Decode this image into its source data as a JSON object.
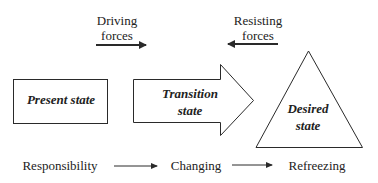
{
  "forces": {
    "driving": {
      "line1": "Driving",
      "line2": "forces"
    },
    "resisting": {
      "line1": "Resisting",
      "line2": "forces"
    }
  },
  "states": {
    "present": "Present state",
    "transition": {
      "line1": "Transition",
      "line2": "state"
    },
    "desired": {
      "line1": "Desired",
      "line2": "state"
    }
  },
  "process": {
    "step1": "Responsibility",
    "step2": "Changing",
    "step3": "Refreezing"
  },
  "colors": {
    "stroke": "#2a2a2a",
    "background": "#ffffff"
  }
}
